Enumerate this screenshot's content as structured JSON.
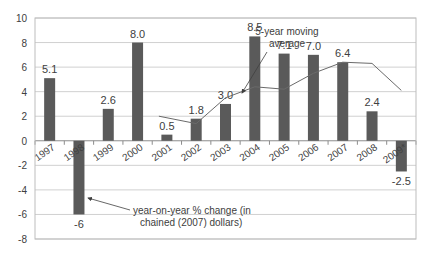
{
  "chart_data": {
    "type": "bar",
    "title": "",
    "xlabel": "",
    "ylabel": "",
    "ylim": [
      -8,
      10
    ],
    "yticks": [
      10,
      8,
      6,
      4,
      2,
      0,
      -2,
      -4,
      -6,
      -8
    ],
    "grid": true,
    "categories": [
      "1997",
      "1998",
      "1999",
      "2000",
      "2001",
      "2002",
      "2003",
      "2004",
      "2005",
      "2006",
      "2007",
      "2008",
      "2009*"
    ],
    "series": [
      {
        "name": "year-on-year % change (in chained (2007) dollars)",
        "type": "bar",
        "values": [
          5.1,
          -6,
          2.6,
          8.0,
          0.5,
          1.8,
          3.0,
          8.5,
          7.1,
          7.0,
          6.4,
          2.4,
          -2.5
        ],
        "labels": [
          "5.1",
          "-6",
          "2.6",
          "8.0",
          "0.5",
          "1.8",
          "3.0",
          "8.5",
          "7.1",
          "7.0",
          "6.4",
          "2.4",
          "-2.5"
        ],
        "color": "#5a5a5a"
      },
      {
        "name": "5-year moving average",
        "type": "line",
        "values": [
          null,
          null,
          null,
          null,
          2.0,
          1.4,
          3.5,
          4.4,
          4.2,
          5.5,
          6.4,
          6.3,
          4.1
        ],
        "color": "#6a6a6a"
      }
    ],
    "annotations": [
      {
        "text_lines": [
          "5-year moving",
          "average"
        ],
        "points_to": "moving average near 2003"
      },
      {
        "text_lines": [
          "year-on-year % change (in",
          "chained (2007) dollars)"
        ],
        "points_to": "1998 bar"
      }
    ]
  }
}
